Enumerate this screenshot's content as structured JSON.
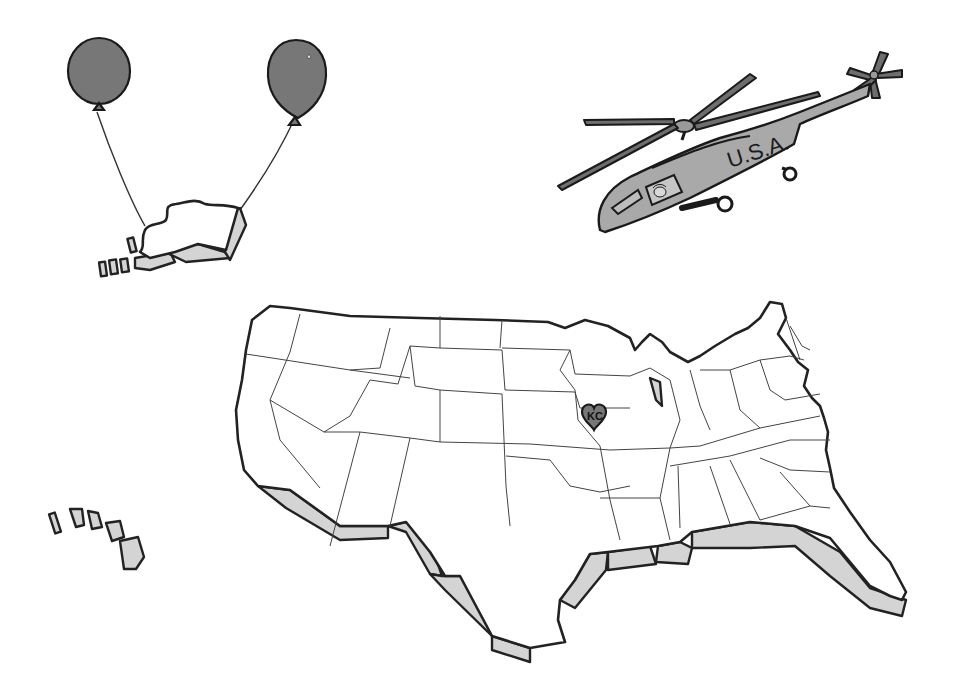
{
  "illustration": {
    "title": "",
    "background": "#ffffff",
    "helicopter": {
      "label": "U.S.A.",
      "body_color": "#a9a9a9",
      "rotor_color": "#6e6e6e"
    },
    "balloons": {
      "count": 2,
      "color": "#777777",
      "carrying": "alaska"
    },
    "main_map": {
      "region": "contiguous-united-states",
      "marker": {
        "label": "KC",
        "shape": "heart",
        "color": "#777777"
      },
      "extrusion_color": "#d4d4d4"
    },
    "hawaii": {
      "island_count": 5
    }
  }
}
